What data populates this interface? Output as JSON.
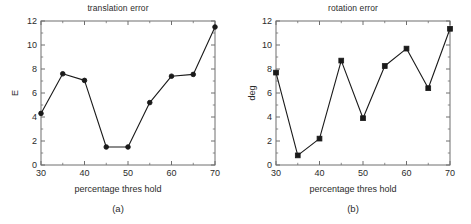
{
  "figures": [
    {
      "id": "a",
      "caption": "(a)",
      "title": "translation error",
      "ylabel": "E",
      "xlabel": "percentage thres hold"
    },
    {
      "id": "b",
      "caption": "(b)",
      "title": "rotation error",
      "ylabel": "deg",
      "xlabel": "percentage thres hold"
    }
  ],
  "chart_data": [
    {
      "type": "line",
      "title": "translation error",
      "xlabel": "percentage thres hold",
      "ylabel": "E",
      "x": [
        30,
        35,
        40,
        45,
        50,
        55,
        60,
        65,
        70
      ],
      "values": [
        4.3,
        7.6,
        7.05,
        1.5,
        1.5,
        5.2,
        7.4,
        7.55,
        11.5
      ],
      "xlim": [
        30,
        70
      ],
      "ylim": [
        0,
        12
      ],
      "xticks": [
        30,
        40,
        50,
        60,
        70
      ],
      "yticks": [
        0,
        2,
        4,
        6,
        8,
        10,
        12
      ],
      "xtick_labels": [
        "30",
        "40",
        "50",
        "60",
        "70"
      ],
      "ytick_labels": [
        "0",
        "2",
        "4",
        "6",
        "8",
        "10",
        "12"
      ],
      "xminor_ticks": [
        35,
        45,
        55,
        65
      ],
      "yminor_ticks": [
        1,
        3,
        5,
        7,
        9,
        11
      ],
      "marker": "circle",
      "grid": false,
      "legend": null,
      "line_color": "#1a1a1a",
      "marker_color": "#1a1a1a"
    },
    {
      "type": "line",
      "title": "rotation error",
      "xlabel": "percentage thres hold",
      "ylabel": "deg",
      "x": [
        30,
        35,
        40,
        45,
        50,
        55,
        60,
        65,
        70
      ],
      "values": [
        7.7,
        0.8,
        2.2,
        8.7,
        3.9,
        8.25,
        9.7,
        6.4,
        11.35
      ],
      "xlim": [
        30,
        70
      ],
      "ylim": [
        0,
        12
      ],
      "xticks": [
        30,
        40,
        50,
        60,
        70
      ],
      "yticks": [
        0,
        2,
        4,
        6,
        8,
        10,
        12
      ],
      "xtick_labels": [
        "30",
        "40",
        "50",
        "60",
        "70"
      ],
      "ytick_labels": [
        "0",
        "2",
        "4",
        "6",
        "8",
        "10",
        "12"
      ],
      "xminor_ticks": [
        35,
        45,
        55,
        65
      ],
      "yminor_ticks": [
        1,
        3,
        5,
        7,
        9,
        11
      ],
      "marker": "square",
      "grid": false,
      "legend": null,
      "line_color": "#1a1a1a",
      "marker_color": "#1a1a1a"
    }
  ],
  "colors": {
    "axis": "#6e6e6e",
    "text": "#2b2b2b",
    "line": "#1a1a1a",
    "background": "#ffffff"
  }
}
